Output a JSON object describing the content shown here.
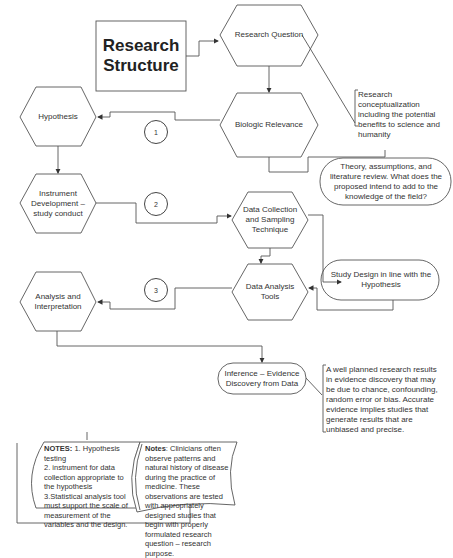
{
  "title": "Research Structure",
  "nodes": {
    "research_question": "Research Question",
    "biologic_relevance": "Biologic Relevance",
    "hypothesis": "Hypothesis",
    "instrument_development": "Instrument Development – study conduct",
    "data_collection": "Data Collection and Sampling Technique",
    "data_analysis_tools": "Data Analysis Tools",
    "analysis_interpretation": "Analysis and Interpretation",
    "inference": "Inference – Evidence Discovery from Data",
    "theory": "Theory, assumptions, and literature review. What does the proposed intend to add to the knowledge of the field?",
    "study_design": "Study Design in line with the Hypothesis"
  },
  "steps": [
    "1",
    "2",
    "3"
  ],
  "annotations": {
    "conceptualization": "Research conceptualization including the potential benefits to science and humanity",
    "evidence": "A well planned research results in evidence discovery that may be due to chance, confounding, random error or bias. Accurate evidence implies studies that generate results that are unbiased and precise."
  },
  "notes_left": {
    "heading": "NOTES:",
    "text_1": " 1. Hypothesis testing",
    "text_2": "2. instrument for data collection appropriate to the hypothesis",
    "text_3": "3.Statistical analysis tool must support the scale of measurement of the variables and the design."
  },
  "notes_right": {
    "heading": "Notes",
    "text": ": Clinicians often observe patterns and natural history of disease during the practice of medicine. These observations are tested with appropriately designed studies that begin with properly formulated research question – research purpose."
  },
  "colors": {
    "line": "#444444",
    "text": "#333333",
    "background": "#ffffff"
  }
}
